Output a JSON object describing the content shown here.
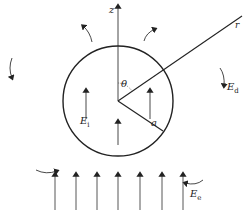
{
  "diagram": {
    "type": "physics-field-diagram",
    "labels": {
      "z_axis": "z",
      "radial": "r",
      "angle": "θ",
      "radius": "a",
      "internal_field": "E",
      "internal_field_sub": "i",
      "dipole_field": "E",
      "dipole_field_sub": "d",
      "external_field": "E",
      "external_field_sub": "e"
    },
    "geometry": {
      "circle_center": [
        118,
        101
      ],
      "circle_radius": 55,
      "external_arrow_count": 7
    },
    "colors": {
      "line": "#222222",
      "arrow": "#444444"
    }
  }
}
